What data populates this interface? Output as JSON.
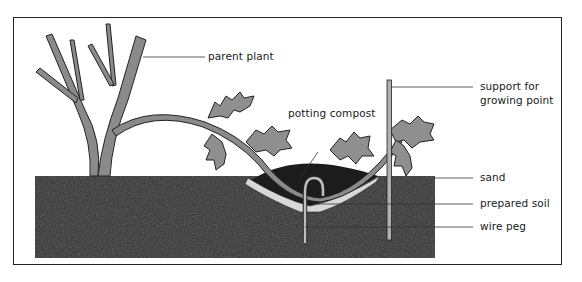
{
  "diagram": {
    "type": "layering illustration",
    "labels": {
      "parent_plant": "parent plant",
      "potting_compost": "potting compost",
      "support_line1": "support for",
      "support_line2": "growing point",
      "sand": "sand",
      "prepared_soil": "prepared soil",
      "wire_peg": "wire peg"
    },
    "colors": {
      "soil": "#3a3a3a",
      "compost": "#1c1c1c",
      "stem": "#8a8a8a",
      "leaf": "#8f8f8f",
      "sand": "#d8d8d8",
      "outline": "#222222"
    }
  }
}
